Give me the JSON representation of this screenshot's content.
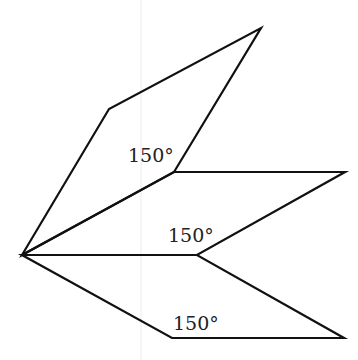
{
  "diagram": {
    "type": "geometry-figure",
    "apex": [
      22,
      255
    ],
    "shapes": [
      {
        "name": "top-rhombus",
        "vertices": [
          [
            22,
            255
          ],
          [
            109,
            109
          ],
          [
            261,
            28
          ],
          [
            174,
            172
          ]
        ],
        "angle_label": "150°",
        "label_pos": [
          128,
          162
        ]
      },
      {
        "name": "middle-rhombus",
        "vertices": [
          [
            22,
            255
          ],
          [
            174,
            172
          ],
          [
            345,
            172
          ],
          [
            197,
            255
          ]
        ],
        "angle_label": "150°",
        "label_pos": [
          168,
          242
        ]
      },
      {
        "name": "bottom-rhombus",
        "vertices": [
          [
            22,
            255
          ],
          [
            197,
            255
          ],
          [
            344,
            338
          ],
          [
            172,
            338
          ]
        ],
        "angle_label": "150°",
        "label_pos": [
          173,
          330
        ]
      }
    ],
    "colors": {
      "stroke": "#111111",
      "label": "#222222",
      "background": "#ffffff"
    }
  }
}
